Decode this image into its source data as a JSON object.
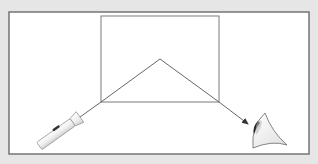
{
  "diagram": {
    "colors": {
      "page_background": "#e6e6e6",
      "frame_fill": "#ffffff",
      "frame_stroke": "#6b6b6b",
      "block_stroke": "#7a7a7a",
      "ray_stroke": "#555555",
      "flashlight_body": "#f2f2f2",
      "flashlight_outline": "#9a9a9a",
      "flashlight_switch": "#333333",
      "eye_fill": "#f4f4f4",
      "eye_outline": "#777777",
      "pupil": "#222222"
    },
    "frame": {
      "x": 9,
      "y": 12,
      "width": 300,
      "height": 142
    },
    "block": {
      "x": 101,
      "y": 16,
      "width": 118,
      "height": 86
    },
    "ray": {
      "points": [
        {
          "x": 80,
          "y": 117,
          "label": "source"
        },
        {
          "x": 101,
          "y": 102,
          "label": "entry"
        },
        {
          "x": 160,
          "y": 59,
          "label": "reflection-point"
        },
        {
          "x": 219,
          "y": 102,
          "label": "exit"
        },
        {
          "x": 248,
          "y": 124,
          "label": "arrow-tip"
        }
      ]
    },
    "elements": {
      "light_source": "flashlight",
      "observer": "eye"
    }
  }
}
